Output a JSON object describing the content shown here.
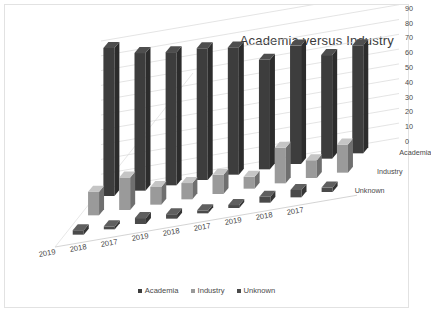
{
  "chart_data": {
    "type": "bar",
    "title": "Academia versus Industry",
    "subtitle": "",
    "xlabel": "",
    "ylabel": "",
    "ylim": [
      0,
      100
    ],
    "yticks": [
      0,
      10,
      20,
      30,
      40,
      50,
      60,
      70,
      80,
      90,
      100
    ],
    "ytick_labels": [
      "0",
      "10",
      "20",
      "30",
      "40",
      "50",
      "60",
      "70",
      "80",
      "90",
      "100"
    ],
    "grid": true,
    "three_d": true,
    "legend_position": "bottom",
    "categories": [
      "2019",
      "2018",
      "2017",
      "2019",
      "2018",
      "2017",
      "2019",
      "2018",
      "2017"
    ],
    "depth_axis_labels": [
      "Academia",
      "Industry",
      "Unknown"
    ],
    "series": [
      {
        "name": "Academia",
        "color": "#3d3d3d",
        "values": [
          100,
          93,
          90,
          89,
          86,
          74,
          80,
          70,
          73
        ]
      },
      {
        "name": "Industry",
        "color": "#9a9a9a",
        "values": [
          16,
          22,
          12,
          11,
          13,
          8,
          24,
          12,
          19
        ]
      },
      {
        "name": "Unknown",
        "color": "#4a4a4a",
        "values": [
          3,
          2,
          4,
          3,
          2,
          2,
          4,
          5,
          3
        ]
      }
    ],
    "legend": [
      {
        "label": "Academia",
        "color": "#3d3d3d"
      },
      {
        "label": "Industry",
        "color": "#9a9a9a"
      },
      {
        "label": "Unknown",
        "color": "#4a4a4a"
      }
    ]
  },
  "caption": {
    "text": ""
  }
}
